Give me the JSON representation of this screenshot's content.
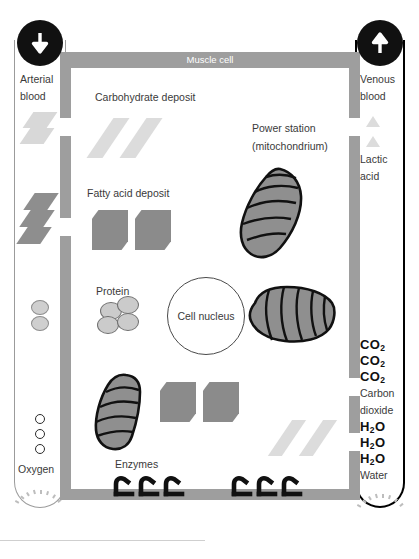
{
  "diagram": {
    "cell_label": "Muscle cell"
  },
  "arterial_vessel": {
    "name": "arterial-blood-vessel",
    "label_line1": "Arterial",
    "label_line2": "blood",
    "arrow_icon": "arrow-down-icon",
    "arrow_direction": "down",
    "contents": [
      {
        "kind": "carbohydrate",
        "label": ""
      },
      {
        "kind": "fatty-acid",
        "label": ""
      },
      {
        "kind": "protein",
        "label": ""
      },
      {
        "kind": "oxygen",
        "label": "O"
      }
    ],
    "oxygen_letters": [
      "O",
      "O",
      "O"
    ],
    "oxygen_label": "Oxygen"
  },
  "venous_vessel": {
    "name": "venous-blood-vessel",
    "label_line1": "Venous",
    "label_line2": "blood",
    "arrow_icon": "arrow-up-icon",
    "arrow_direction": "up",
    "lactic_label_line1": "Lactic",
    "lactic_label_line2": "acid",
    "carbon_dioxide": {
      "formulas": [
        "CO",
        "CO",
        "CO"
      ],
      "subscript": "2",
      "label_line1": "Carbon",
      "label_line2": "dioxide"
    },
    "water": {
      "formulas": [
        "H",
        "H",
        "H"
      ],
      "subscript": "2",
      "suffix": "O",
      "label": "Water"
    }
  },
  "cell_contents": {
    "carbohydrate_label": "Carbohydrate deposit",
    "fatty_acid_label": "Fatty acid deposit",
    "protein_label": "Protein",
    "nucleus_label": "Cell nucleus",
    "enzymes_label": "Enzymes",
    "mitochondrion": {
      "label_line1": "Power station",
      "label_line2": "(mitochondrium)"
    }
  },
  "colors": {
    "membrane": "#9e9e9e",
    "carbohydrate": "#dcdcdc",
    "fatty_acid": "#8b8b8b",
    "protein": "#cbcbcb",
    "mitochondrion_fill": "#8f8f8f",
    "vein_outline": "#000000",
    "artery_outline": "#9b9b9b",
    "text": "#3a3a3a"
  }
}
